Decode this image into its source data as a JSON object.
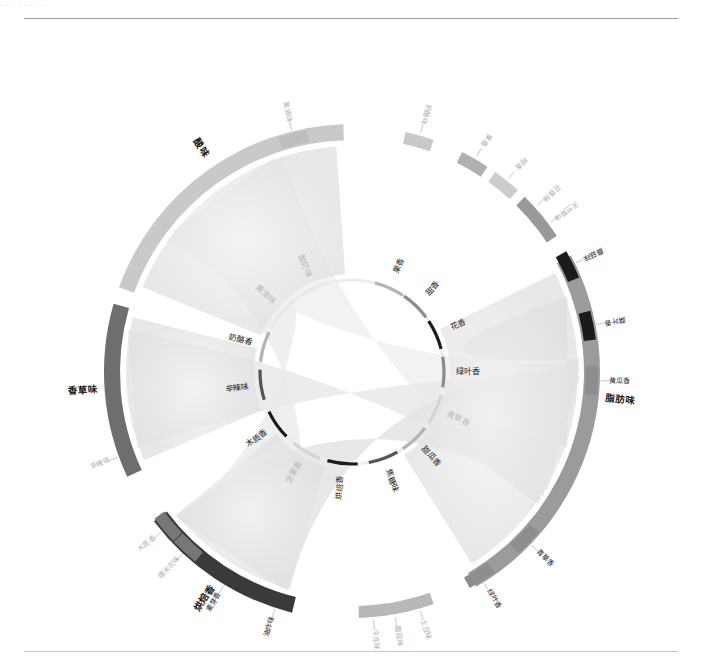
{
  "page": {
    "top_caption": "· · · · · · · ·",
    "background": "#ffffff"
  },
  "chart_data": {
    "type": "chord",
    "title": "",
    "palette": {
      "dark": "#1b1b1b",
      "mid_dark": "#555555",
      "mid": "#8d8d8d",
      "mid_light": "#b3b3b3",
      "light": "#d4d4d4",
      "very_light": "#e8e8e8",
      "ribbon_light": "#efefef",
      "ribbon_mid": "#dcdcdc"
    },
    "inner_ring_label": "inner attribute ring",
    "inner_nodes": [
      {
        "label": "果香",
        "angle": -66,
        "color": "#b3b3b3",
        "faint": false
      },
      {
        "label": "甜香",
        "angle": -46,
        "color": "#8d8d8d",
        "faint": false
      },
      {
        "label": "花香",
        "angle": -24,
        "color": "#1b1b1b",
        "faint": false
      },
      {
        "label": "绿叶香",
        "angle": 0,
        "color": "#8d8d8d",
        "faint": false
      },
      {
        "label": "青草香",
        "angle": 24,
        "color": "#d4d4d4",
        "faint": true
      },
      {
        "label": "甜瓜香",
        "angle": 47,
        "color": "#b3b3b3",
        "faint": false
      },
      {
        "label": "焦糖味",
        "angle": 70,
        "color": "#555555",
        "faint": false
      },
      {
        "label": "烘焙香",
        "angle": 96,
        "color": "#1b1b1b",
        "faint": false
      },
      {
        "label": "坚果香",
        "angle": 120,
        "color": "#d4d4d4",
        "faint": true
      },
      {
        "label": "木质香",
        "angle": 145,
        "color": "#1b1b1b",
        "faint": false
      },
      {
        "label": "辛辣味",
        "angle": 172,
        "color": "#555555",
        "faint": false
      },
      {
        "label": "奶酪香",
        "angle": 196,
        "color": "#b3b3b3",
        "faint": false
      },
      {
        "label": "黄油味",
        "angle": 222,
        "color": "#e8e8e8",
        "faint": true
      },
      {
        "label": "酸奶味",
        "angle": 246,
        "color": "#e8e8e8",
        "faint": true
      }
    ],
    "groups": [
      {
        "label": "酸味",
        "start": 200,
        "end": 268,
        "color": "#c9c9c9",
        "label_angle": 236,
        "bold": true
      },
      {
        "label": "香草味",
        "start": 155,
        "end": 196,
        "color": "#6e6e6e",
        "label_angle": 176,
        "bold": true
      },
      {
        "label": "烘焙香",
        "start": 104,
        "end": 143,
        "color": "#3a3a3a",
        "label_angle": 123,
        "bold": true
      },
      {
        "label": "脂肪味",
        "start": -28,
        "end": 60,
        "color": "#9b9b9b",
        "label_angle": 6,
        "bold": true
      }
    ],
    "outer_segments": [
      {
        "label": "奶酪味",
        "angle": 286,
        "color": "#c9c9c9",
        "faint": true
      },
      {
        "label": "黄油味",
        "angle": 256,
        "color": "#bdbdbd",
        "faint": true
      },
      {
        "label": "果香",
        "angle": 300,
        "color": "#b0b0b0",
        "faint": true
      },
      {
        "label": "柑香",
        "angle": 309,
        "color": "#cccccc",
        "faint": true
      },
      {
        "label": "花香味",
        "angle": 318,
        "color": "#999999",
        "faint": true
      },
      {
        "label": "天竺葵味",
        "angle": 323,
        "color": "#999999",
        "faint": true
      },
      {
        "label": "蘑菇味",
        "angle": 334,
        "color": "#1b1b1b",
        "faint": false
      },
      {
        "label": "腐叶香",
        "angle": 349,
        "color": "#1b1b1b",
        "faint": false
      },
      {
        "label": "黄瓜香",
        "angle": 2,
        "color": "#8d8d8d",
        "faint": false
      },
      {
        "label": "青草香",
        "angle": 44,
        "color": "#8d8d8d",
        "faint": false
      },
      {
        "label": "绿叶香",
        "angle": 58,
        "color": "#8d8d8d",
        "faint": false
      },
      {
        "label": "土豆味",
        "angle": 74,
        "color": "#b8b8b8",
        "faint": true
      },
      {
        "label": "蘑菇味",
        "angle": 80,
        "color": "#b8b8b8",
        "faint": true
      },
      {
        "label": "冷冻味",
        "angle": 85,
        "color": "#b8b8b8",
        "faint": true
      },
      {
        "label": "油炸味",
        "angle": 108,
        "color": "#3a3a3a",
        "faint": false
      },
      {
        "label": "麦芽香",
        "angle": 121,
        "color": "#3a3a3a",
        "faint": false
      },
      {
        "label": "爆米花味",
        "angle": 133,
        "color": "#777777",
        "faint": true
      },
      {
        "label": "木质香",
        "angle": 140,
        "color": "#777777",
        "faint": true
      },
      {
        "label": "辛辣味",
        "angle": 160,
        "color": "#6e6e6e",
        "faint": true
      }
    ],
    "ribbons": [
      {
        "from": "酸味",
        "to": "烘焙香",
        "weight": 0.55,
        "color": "#ededed"
      },
      {
        "from": "酸味",
        "to": "脂肪味",
        "weight": 0.72,
        "color": "#f1f1f1"
      },
      {
        "from": "香草味",
        "to": "脂肪味",
        "weight": 0.48,
        "color": "#eaeaea"
      },
      {
        "from": "烘焙香",
        "to": "脂肪味",
        "weight": 0.63,
        "color": "#e6e6e6"
      },
      {
        "from": "脂肪味",
        "to": "绿叶香",
        "weight": 0.8,
        "color": "#e2e2e2"
      }
    ],
    "radii": {
      "inner": 92,
      "group_inner": 232,
      "group_outer": 248
    },
    "center": {
      "x": 352,
      "y": 372
    }
  }
}
